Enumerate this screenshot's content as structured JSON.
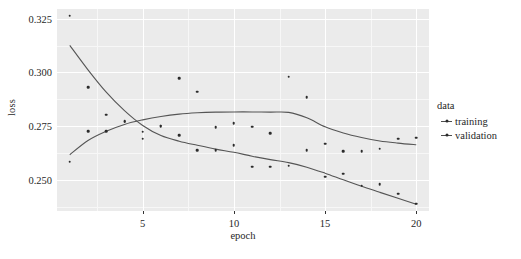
{
  "chart_data": {
    "type": "scatter",
    "title": "",
    "xlabel": "epoch",
    "ylabel": "loss",
    "xlim": [
      0.3,
      20.7
    ],
    "ylim": [
      0.2355,
      0.3295
    ],
    "xticks": [
      5,
      10,
      15,
      20
    ],
    "xticklabels": [
      "5",
      "10",
      "15",
      "20"
    ],
    "yticks": [
      0.25,
      0.275,
      0.3,
      0.325
    ],
    "yticklabels": [
      "0.250",
      "0.275",
      "0.300",
      "0.325"
    ],
    "grid": true,
    "legend": {
      "title": "data",
      "position": "right",
      "entries": [
        {
          "label": "training",
          "key": "line-point"
        },
        {
          "label": "validation",
          "key": "line-point"
        }
      ]
    },
    "x": [
      1,
      2,
      3,
      4,
      5,
      6,
      7,
      8,
      9,
      10,
      11,
      12,
      13,
      14,
      15,
      16,
      17,
      18,
      19,
      20
    ],
    "series": [
      {
        "name": "training",
        "values": [
          0.2585,
          0.2726,
          0.2727,
          0.2771,
          0.2692,
          0.2749,
          0.2707,
          0.2638,
          0.2637,
          0.2662,
          0.2561,
          0.256,
          0.2566,
          0.2637,
          0.2515,
          0.2529,
          0.2473,
          0.2479,
          0.2436,
          0.239
        ],
        "smooth": [
          [
            1,
            0.2617
          ],
          [
            2,
            0.2683
          ],
          [
            3,
            0.2726
          ],
          [
            4,
            0.2758
          ],
          [
            5,
            0.2779
          ],
          [
            6,
            0.2795
          ],
          [
            7,
            0.2806
          ],
          [
            8,
            0.2812
          ],
          [
            9,
            0.2815
          ],
          [
            10,
            0.2816
          ],
          [
            11,
            0.2816
          ],
          [
            12,
            0.2815
          ],
          [
            13,
            0.2814
          ],
          [
            14,
            0.2789
          ],
          [
            15,
            0.2747
          ],
          [
            16,
            0.2718
          ],
          [
            17,
            0.2697
          ],
          [
            18,
            0.2681
          ],
          [
            19,
            0.2671
          ],
          [
            20,
            0.2663
          ]
        ]
      },
      {
        "name": "validation",
        "values": [
          0.3264,
          0.2931,
          0.2804,
          0.2773,
          0.2725,
          0.2753,
          0.2972,
          0.2911,
          0.2745,
          0.2763,
          0.2748,
          0.2717,
          0.2981,
          0.2885,
          0.2669,
          0.2634,
          0.2634,
          0.2645,
          0.2692,
          0.2695
        ],
        "smooth": [
          [
            1,
            0.3126
          ],
          [
            2,
            0.3012
          ],
          [
            3,
            0.2908
          ],
          [
            4,
            0.2822
          ],
          [
            5,
            0.2753
          ],
          [
            6,
            0.2706
          ],
          [
            7,
            0.268
          ],
          [
            8,
            0.2661
          ],
          [
            9,
            0.2643
          ],
          [
            10,
            0.2628
          ],
          [
            11,
            0.261
          ],
          [
            12,
            0.2594
          ],
          [
            13,
            0.258
          ],
          [
            14,
            0.2559
          ],
          [
            15,
            0.2531
          ],
          [
            16,
            0.25
          ],
          [
            17,
            0.247
          ],
          [
            18,
            0.2442
          ],
          [
            19,
            0.2414
          ],
          [
            20,
            0.2386
          ]
        ]
      }
    ],
    "minor_y": [
      0.2375,
      0.2625,
      0.2875,
      0.3125
    ],
    "minor_x": [
      2.5,
      7.5,
      12.5,
      17.5
    ]
  },
  "caption": {
    "text": ""
  }
}
